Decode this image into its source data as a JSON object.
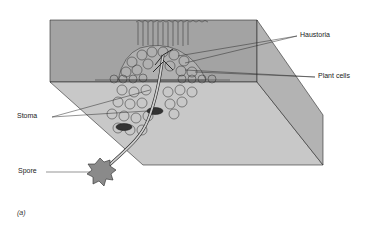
{
  "figure": {
    "caption": "(a)",
    "labels": {
      "haustoria": "Haustoria",
      "plant_cells": "Plant cells",
      "stoma": "Stoma",
      "spore": "Spore"
    },
    "colors": {
      "front_face": "#9a9a9a",
      "top_face": "#c4c4c4",
      "right_face": "#b3b3b3",
      "line": "#2a2a2a",
      "stoma": "#333333"
    }
  }
}
